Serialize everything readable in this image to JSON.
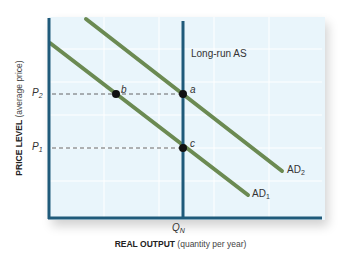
{
  "diagram": {
    "type": "aggregate-demand-supply",
    "y_axis": {
      "label_bold": "PRICE LEVEL",
      "label_normal": "(average price)"
    },
    "x_axis": {
      "label_bold": "REAL OUTPUT",
      "label_normal": "(quantity per year)"
    },
    "price_levels": [
      {
        "symbol": "P",
        "subscript": "2"
      },
      {
        "symbol": "P",
        "subscript": "1"
      }
    ],
    "output_levels": [
      {
        "symbol": "Q",
        "subscript": "N"
      }
    ],
    "curves": [
      {
        "id": "lras",
        "label": "Long-run AS",
        "kind": "vertical"
      },
      {
        "id": "ad1",
        "label_main": "AD",
        "label_sub": "1",
        "kind": "downward"
      },
      {
        "id": "ad2",
        "label_main": "AD",
        "label_sub": "2",
        "kind": "downward"
      }
    ],
    "points": [
      {
        "label": "a"
      },
      {
        "label": "b"
      },
      {
        "label": "c"
      }
    ],
    "colors": {
      "axis": "#1f5a7a",
      "plot_bg": "#e9f5fb",
      "grid": "#ffffff",
      "ad_curve": "#6b8a52",
      "lras": "#1f5a7a",
      "dashed": "#555555",
      "point": "#111111"
    }
  }
}
